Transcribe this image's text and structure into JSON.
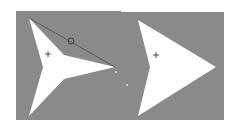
{
  "diagram": {
    "background": "#ffffff",
    "panel_color": "#8a8a8a",
    "shape_fill": "#ffffff",
    "line_color": "#505050",
    "panels": [
      {
        "name": "left-panel",
        "x": 16,
        "y": 11,
        "width": 104,
        "height": 109
      },
      {
        "name": "right-panel",
        "x": 120,
        "y": 12,
        "width": 104,
        "height": 108
      }
    ],
    "shapes": [
      {
        "name": "concave-arrowhead",
        "points": "29,18 64,55 115,67 64,79 29,116 43,67",
        "center_marker": {
          "x": 48,
          "y": 54
        },
        "control_line": {
          "x1": 29,
          "y1": 18,
          "x2": 115,
          "y2": 67
        },
        "control_handle": {
          "x": 71,
          "y": 41,
          "r": 3
        }
      },
      {
        "name": "chevron-arrowhead",
        "points": "138,20 216,67 138,116 150,67",
        "center_marker": {
          "x": 156,
          "y": 55
        }
      }
    ],
    "dots": [
      {
        "x": 116,
        "y": 72
      },
      {
        "x": 127,
        "y": 85
      }
    ]
  }
}
